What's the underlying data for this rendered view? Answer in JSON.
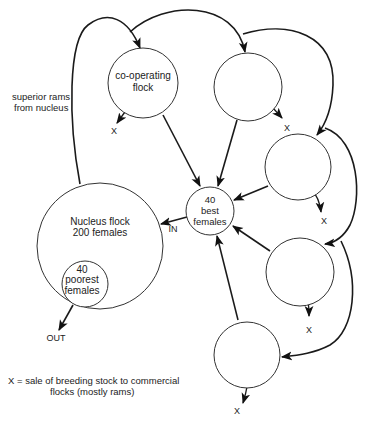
{
  "diagram": {
    "type": "flow",
    "nodes": {
      "cooperating": {
        "line1": "co-operating",
        "line2": "flock"
      },
      "nucleus": {
        "line1": "Nucleus flock",
        "line2": "200 females"
      },
      "poorest": {
        "line1": "40",
        "line2": "poorest",
        "line3": "females"
      },
      "best": {
        "line1": "40",
        "line2": "best",
        "line3": "females"
      },
      "flock2": {
        "label": ""
      },
      "flock3": {
        "label": ""
      },
      "flock4": {
        "label": ""
      },
      "flock5": {
        "label": ""
      }
    },
    "labels": {
      "superior_rams_1": "superior rams",
      "superior_rams_2": "from nucleus",
      "in": "IN",
      "out": "OUT",
      "x": "X"
    },
    "legend": {
      "line1": "X = sale of breeding stock to commercial",
      "line2": "flocks (mostly rams)"
    },
    "edges": [
      {
        "from": "nucleus",
        "to": "cooperating",
        "label": "superior rams from nucleus"
      },
      {
        "from": "cooperating",
        "to": "flock2"
      },
      {
        "from": "flock2",
        "to": "flock3"
      },
      {
        "from": "flock3",
        "to": "flock4"
      },
      {
        "from": "flock4",
        "to": "flock5"
      },
      {
        "from": "cooperating",
        "to": "best"
      },
      {
        "from": "flock2",
        "to": "best"
      },
      {
        "from": "flock3",
        "to": "best"
      },
      {
        "from": "flock4",
        "to": "best"
      },
      {
        "from": "flock5",
        "to": "best"
      },
      {
        "from": "best",
        "to": "nucleus",
        "label": "IN"
      },
      {
        "from": "poorest",
        "to": "out",
        "label": "OUT"
      },
      {
        "from": "cooperating",
        "to": "X"
      },
      {
        "from": "flock2",
        "to": "X"
      },
      {
        "from": "flock3",
        "to": "X"
      },
      {
        "from": "flock4",
        "to": "X"
      },
      {
        "from": "flock5",
        "to": "X"
      }
    ]
  }
}
